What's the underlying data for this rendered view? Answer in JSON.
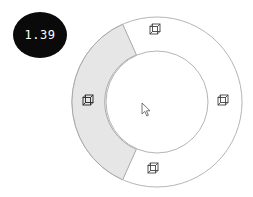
{
  "badge": {
    "value": "1.39"
  },
  "pie_menu": {
    "center": [
      157,
      102
    ],
    "outer_radius": 85,
    "inner_radius": 51,
    "highlight_color": "#e6e6e6",
    "border_color": "#b0b0b0",
    "items": [
      {
        "icon": "cube-icon",
        "position": "top",
        "selected": false
      },
      {
        "icon": "cube-icon",
        "position": "right",
        "selected": false
      },
      {
        "icon": "cube-icon",
        "position": "bottom",
        "selected": false
      },
      {
        "icon": "cube-icon",
        "position": "left",
        "selected": true
      }
    ]
  },
  "cursor": {
    "icon": "arrow-cursor-icon"
  }
}
